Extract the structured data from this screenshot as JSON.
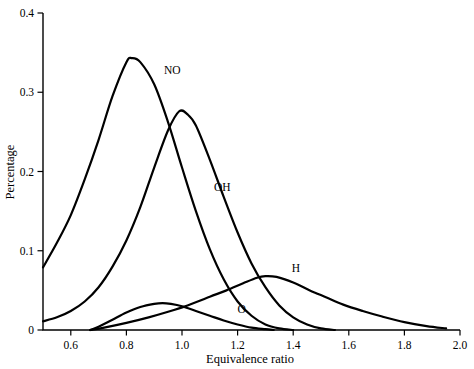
{
  "chart_data": {
    "type": "line",
    "title": "",
    "xlabel": "Equivalence ratio",
    "ylabel": "Percentage",
    "xlim": [
      0.5,
      2.0
    ],
    "ylim": [
      0.0,
      0.4
    ],
    "grid": false,
    "legend": "inline-labels",
    "xticks": [
      "0.6",
      "0.8",
      "1.0",
      "1.2",
      "1.4",
      "1.6",
      "1.8",
      "2.0"
    ],
    "xtick_values": [
      0.6,
      0.8,
      1.0,
      1.2,
      1.4,
      1.6,
      1.8,
      2.0
    ],
    "yticks": [
      "0",
      "0.1",
      "0.2",
      "0.3",
      "0.4"
    ],
    "ytick_values": [
      0,
      0.1,
      0.2,
      0.3,
      0.4
    ],
    "series": [
      {
        "name": "NO",
        "label": "NO",
        "color": "#000000",
        "peak_x": 0.82,
        "peak_y": 0.343,
        "x": [
          0.5,
          0.55,
          0.6,
          0.65,
          0.7,
          0.75,
          0.8,
          0.82,
          0.85,
          0.9,
          0.95,
          1.0,
          1.05,
          1.1,
          1.15,
          1.2,
          1.25,
          1.3,
          1.35,
          1.4
        ],
        "y": [
          0.079,
          0.11,
          0.145,
          0.19,
          0.24,
          0.295,
          0.338,
          0.343,
          0.338,
          0.31,
          0.262,
          0.205,
          0.15,
          0.102,
          0.064,
          0.036,
          0.018,
          0.007,
          0.002,
          0.0
        ]
      },
      {
        "name": "OH",
        "label": "OH",
        "color": "#000000",
        "peak_x": 0.99,
        "peak_y": 0.276,
        "x": [
          0.5,
          0.55,
          0.6,
          0.65,
          0.7,
          0.75,
          0.8,
          0.85,
          0.9,
          0.95,
          0.99,
          1.02,
          1.05,
          1.1,
          1.15,
          1.2,
          1.25,
          1.3,
          1.35,
          1.4,
          1.45,
          1.5,
          1.55
        ],
        "y": [
          0.011,
          0.016,
          0.024,
          0.036,
          0.054,
          0.08,
          0.113,
          0.155,
          0.205,
          0.252,
          0.276,
          0.272,
          0.258,
          0.215,
          0.168,
          0.123,
          0.084,
          0.054,
          0.031,
          0.016,
          0.007,
          0.002,
          0.0
        ]
      },
      {
        "name": "O",
        "label": "O",
        "color": "#000000",
        "peak_x": 0.93,
        "peak_y": 0.034,
        "x": [
          0.67,
          0.7,
          0.75,
          0.8,
          0.85,
          0.9,
          0.93,
          0.96,
          1.0,
          1.05,
          1.1,
          1.15,
          1.2,
          1.25,
          1.3,
          1.33
        ],
        "y": [
          0.0,
          0.004,
          0.013,
          0.022,
          0.029,
          0.033,
          0.034,
          0.033,
          0.03,
          0.024,
          0.018,
          0.012,
          0.007,
          0.003,
          0.001,
          0.0
        ]
      },
      {
        "name": "H",
        "label": "H",
        "color": "#000000",
        "peak_x": 1.3,
        "peak_y": 0.068,
        "x": [
          0.67,
          0.72,
          0.8,
          0.88,
          0.95,
          1.02,
          1.1,
          1.16,
          1.22,
          1.27,
          1.3,
          1.34,
          1.4,
          1.46,
          1.52,
          1.58,
          1.65,
          1.72,
          1.8,
          1.88,
          1.95
        ],
        "y": [
          0.0,
          0.003,
          0.009,
          0.016,
          0.023,
          0.031,
          0.042,
          0.05,
          0.059,
          0.066,
          0.068,
          0.067,
          0.06,
          0.05,
          0.041,
          0.032,
          0.024,
          0.017,
          0.01,
          0.005,
          0.002
        ]
      }
    ],
    "annotations": [
      {
        "text": "NO",
        "x": 0.965,
        "y": 0.323
      },
      {
        "text": "OH",
        "x": 1.145,
        "y": 0.175
      },
      {
        "text": "O",
        "x": 1.215,
        "y": 0.022
      },
      {
        "text": "H",
        "x": 1.41,
        "y": 0.073
      }
    ]
  },
  "axes": {
    "x_title": "Equivalence ratio",
    "y_title": "Percentage"
  }
}
